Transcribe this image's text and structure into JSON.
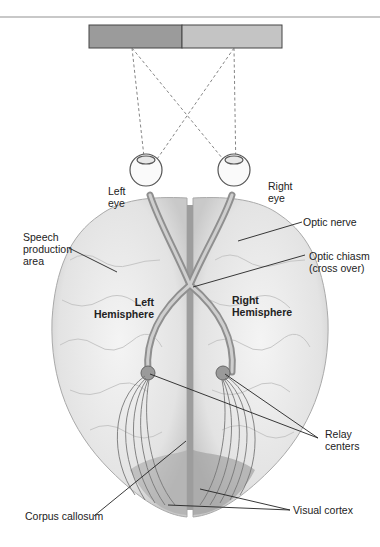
{
  "figure": {
    "type": "anatomical-diagram",
    "stimulus_bar": {
      "left_color": "#9b9b9b",
      "right_color": "#c4c4c4"
    }
  },
  "labels": {
    "left_eye": [
      "Left",
      "eye"
    ],
    "right_eye": [
      "Right",
      "eye"
    ],
    "speech_area": [
      "Speech",
      "production",
      "area"
    ],
    "optic_nerve": "Optic nerve",
    "optic_chiasm": [
      "Optic chiasm",
      "(cross over)"
    ],
    "left_hemisphere": [
      "Left",
      "Hemisphere"
    ],
    "right_hemisphere": [
      "Right",
      "Hemisphere"
    ],
    "relay_centers": [
      "Relay",
      "centers"
    ],
    "corpus_callosum": "Corpus callosum",
    "visual_cortex": "Visual cortex"
  }
}
